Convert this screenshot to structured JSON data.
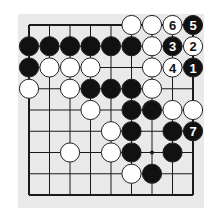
{
  "diagram": {
    "type": "go-problem",
    "board_section": {
      "columns": 9,
      "rows": 9,
      "edges": [
        "top",
        "left",
        "bottom",
        "right"
      ]
    },
    "colors": {
      "background": "#ffffff",
      "panel": "#e9e9e9",
      "line": "#1a1a1a",
      "black_stone": "#111111",
      "white_stone": "#ffffff"
    },
    "grid": {
      "x0": 29,
      "y0": 25,
      "dx": 20.5,
      "dy": 21.25
    },
    "star_points": [
      {
        "col": 6,
        "row": 6
      }
    ],
    "stones": [
      {
        "col": 5,
        "row": 0,
        "color": "white",
        "label": ""
      },
      {
        "col": 6,
        "row": 0,
        "color": "white",
        "label": ""
      },
      {
        "col": 7,
        "row": 0,
        "color": "white",
        "label": "6"
      },
      {
        "col": 8,
        "row": 0,
        "color": "black",
        "label": "5"
      },
      {
        "col": 0,
        "row": 1,
        "color": "black",
        "label": ""
      },
      {
        "col": 1,
        "row": 1,
        "color": "black",
        "label": ""
      },
      {
        "col": 2,
        "row": 1,
        "color": "black",
        "label": ""
      },
      {
        "col": 3,
        "row": 1,
        "color": "black",
        "label": ""
      },
      {
        "col": 4,
        "row": 1,
        "color": "black",
        "label": ""
      },
      {
        "col": 5,
        "row": 1,
        "color": "black",
        "label": ""
      },
      {
        "col": 6,
        "row": 1,
        "color": "white",
        "label": ""
      },
      {
        "col": 7,
        "row": 1,
        "color": "black",
        "label": "3"
      },
      {
        "col": 8,
        "row": 1,
        "color": "white",
        "label": "2"
      },
      {
        "col": 0,
        "row": 2,
        "color": "black",
        "label": ""
      },
      {
        "col": 1,
        "row": 2,
        "color": "white",
        "label": ""
      },
      {
        "col": 2,
        "row": 2,
        "color": "white",
        "label": ""
      },
      {
        "col": 3,
        "row": 2,
        "color": "white",
        "label": ""
      },
      {
        "col": 6,
        "row": 2,
        "color": "white",
        "label": ""
      },
      {
        "col": 7,
        "row": 2,
        "color": "white",
        "label": "4"
      },
      {
        "col": 8,
        "row": 2,
        "color": "black",
        "label": "1"
      },
      {
        "col": 0,
        "row": 3,
        "color": "white",
        "label": ""
      },
      {
        "col": 2,
        "row": 3,
        "color": "white",
        "label": ""
      },
      {
        "col": 3,
        "row": 3,
        "color": "black",
        "label": ""
      },
      {
        "col": 4,
        "row": 3,
        "color": "black",
        "label": ""
      },
      {
        "col": 5,
        "row": 3,
        "color": "black",
        "label": ""
      },
      {
        "col": 6,
        "row": 3,
        "color": "white",
        "label": ""
      },
      {
        "col": 3,
        "row": 4,
        "color": "white",
        "label": ""
      },
      {
        "col": 5,
        "row": 4,
        "color": "black",
        "label": ""
      },
      {
        "col": 6,
        "row": 4,
        "color": "black",
        "label": ""
      },
      {
        "col": 7,
        "row": 4,
        "color": "white",
        "label": ""
      },
      {
        "col": 8,
        "row": 4,
        "color": "white",
        "label": ""
      },
      {
        "col": 4,
        "row": 5,
        "color": "white",
        "label": ""
      },
      {
        "col": 5,
        "row": 5,
        "color": "black",
        "label": ""
      },
      {
        "col": 7,
        "row": 5,
        "color": "black",
        "label": ""
      },
      {
        "col": 8,
        "row": 5,
        "color": "black",
        "label": "7"
      },
      {
        "col": 2,
        "row": 6,
        "color": "white",
        "label": ""
      },
      {
        "col": 4,
        "row": 6,
        "color": "white",
        "label": ""
      },
      {
        "col": 5,
        "row": 6,
        "color": "black",
        "label": ""
      },
      {
        "col": 7,
        "row": 6,
        "color": "black",
        "label": ""
      },
      {
        "col": 5,
        "row": 7,
        "color": "white",
        "label": ""
      },
      {
        "col": 6,
        "row": 7,
        "color": "black",
        "label": ""
      }
    ]
  }
}
